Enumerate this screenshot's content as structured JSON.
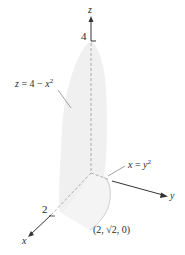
{
  "diagram": {
    "type": "3d-solid-region",
    "axes": {
      "x": {
        "label": "x",
        "tick_label": "2"
      },
      "y": {
        "label": "y"
      },
      "z": {
        "label": "z",
        "tick_label": "4"
      }
    },
    "surfaces": [
      {
        "id": "parabolic-cylinder",
        "equation_lhs": "z",
        "equation_rhs_pre": "= 4 − ",
        "equation_var": "x",
        "equation_exp": "2"
      },
      {
        "id": "base-curve",
        "equation_lhs": "x",
        "equation_rhs_pre": "= ",
        "equation_var": "y",
        "equation_exp": "2"
      }
    ],
    "point": {
      "label": "(2, √2, 0)"
    },
    "colors": {
      "surface_fill": "#f0f0f0",
      "surface_edge": "#d8d8d8",
      "axis": "#333333",
      "dashed": "#9a9a9a",
      "leader": "#8a8a8a"
    }
  }
}
